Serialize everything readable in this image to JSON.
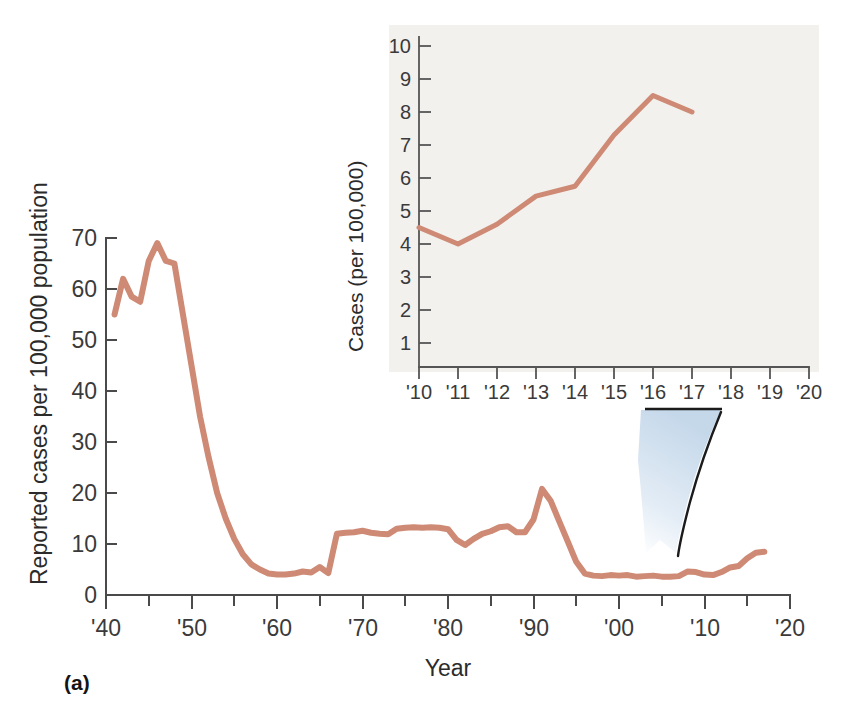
{
  "figure": {
    "panel_label": "(a)",
    "background_color": "#ffffff",
    "line_color": "#ce8a74",
    "inset_panel_color": "#f2f1ee",
    "arrow_color_light": "#dce7f2",
    "arrow_color_edge": "#1b1b1b"
  },
  "main_chart": {
    "ylabel": "Reported cases per 100,000 population",
    "xlabel": "Year",
    "y_ticks": [
      "0",
      "10",
      "20",
      "30",
      "40",
      "50",
      "60",
      "70"
    ],
    "x_ticks": [
      "'40",
      "'50",
      "'60",
      "'70",
      "'80",
      "'90",
      "'00",
      "'10",
      "'20"
    ]
  },
  "inset_chart": {
    "ylabel": "Cases (per 100,000)",
    "y_ticks": [
      "1",
      "2",
      "3",
      "4",
      "5",
      "6",
      "7",
      "8",
      "9",
      "10"
    ],
    "x_ticks": [
      "'10",
      "'11",
      "'12",
      "'13",
      "'14",
      "'15",
      "'16",
      "'17",
      "'18",
      "'19",
      "'20"
    ]
  },
  "chart_data": [
    {
      "type": "line",
      "id": "main",
      "title": "",
      "xlabel": "Year",
      "ylabel": "Reported cases per 100,000 population",
      "xlim": [
        1940,
        2020
      ],
      "ylim": [
        0,
        72
      ],
      "grid": false,
      "legend": "none",
      "x_tick_values": [
        1940,
        1950,
        1960,
        1970,
        1980,
        1990,
        2000,
        2010,
        2020
      ],
      "x_tick_labels": [
        "'40",
        "'50",
        "'60",
        "'70",
        "'80",
        "'90",
        "'00",
        "'10",
        "'20"
      ],
      "x_minor_tick_step": 5,
      "y_tick_values": [
        0,
        10,
        20,
        30,
        40,
        50,
        60,
        70
      ],
      "y_tick_labels": [
        "0",
        "10",
        "20",
        "30",
        "40",
        "50",
        "60",
        "70"
      ],
      "series": [
        {
          "name": "Reported cases per 100,000 population",
          "color": "#ce8a74",
          "x": [
            1941,
            1942,
            1943,
            1944,
            1945,
            1946,
            1947,
            1948,
            1949,
            1950,
            1951,
            1952,
            1953,
            1954,
            1955,
            1956,
            1957,
            1958,
            1959,
            1960,
            1961,
            1962,
            1963,
            1964,
            1965,
            1966,
            1967,
            1968,
            1969,
            1970,
            1971,
            1972,
            1973,
            1974,
            1975,
            1976,
            1977,
            1978,
            1979,
            1980,
            1981,
            1982,
            1983,
            1984,
            1985,
            1986,
            1987,
            1988,
            1989,
            1990,
            1991,
            1992,
            1993,
            1994,
            1995,
            1996,
            1997,
            1998,
            1999,
            2000,
            2001,
            2002,
            2003,
            2004,
            2005,
            2006,
            2007,
            2008,
            2009,
            2010,
            2011,
            2012,
            2013,
            2014,
            2015,
            2016,
            2017
          ],
          "y": [
            55.0,
            62.0,
            58.5,
            57.5,
            65.5,
            69.0,
            65.5,
            65.0,
            55.0,
            45.0,
            35.0,
            27.0,
            20.0,
            15.0,
            11.0,
            8.0,
            6.0,
            5.0,
            4.2,
            4.0,
            4.0,
            4.2,
            4.6,
            4.4,
            5.5,
            4.3,
            12.0,
            12.2,
            12.3,
            12.6,
            12.2,
            12.0,
            11.9,
            13.0,
            13.2,
            13.3,
            13.2,
            13.3,
            13.2,
            12.9,
            10.8,
            9.8,
            11.0,
            12.0,
            12.5,
            13.3,
            13.5,
            12.3,
            12.3,
            14.8,
            20.8,
            18.5,
            14.5,
            10.5,
            6.5,
            4.2,
            3.8,
            3.7,
            3.9,
            3.8,
            3.9,
            3.6,
            3.7,
            3.8,
            3.6,
            3.6,
            3.7,
            4.6,
            4.5,
            4.0,
            3.9,
            4.5,
            5.4,
            5.7,
            7.2,
            8.3,
            8.5
          ]
        }
      ]
    },
    {
      "type": "line",
      "id": "inset",
      "title": "",
      "xlabel": "",
      "ylabel": "Cases (per 100,000)",
      "xlim": [
        2010,
        2020
      ],
      "ylim": [
        0,
        10.6
      ],
      "grid": false,
      "legend": "none",
      "x_tick_values": [
        2010,
        2011,
        2012,
        2013,
        2014,
        2015,
        2016,
        2017,
        2018,
        2019,
        2020
      ],
      "x_tick_labels": [
        "'10",
        "'11",
        "'12",
        "'13",
        "'14",
        "'15",
        "'16",
        "'17",
        "'18",
        "'19",
        "'20"
      ],
      "y_tick_values": [
        1,
        2,
        3,
        4,
        5,
        6,
        7,
        8,
        9,
        10
      ],
      "y_tick_labels": [
        "1",
        "2",
        "3",
        "4",
        "5",
        "6",
        "7",
        "8",
        "9",
        "10"
      ],
      "series": [
        {
          "name": "Cases (per 100,000)",
          "color": "#ce8a74",
          "x": [
            2010,
            2011,
            2012,
            2013,
            2014,
            2015,
            2016,
            2017
          ],
          "y": [
            4.5,
            4.0,
            4.6,
            5.45,
            5.75,
            7.3,
            8.5,
            8.0
          ]
        }
      ]
    }
  ]
}
